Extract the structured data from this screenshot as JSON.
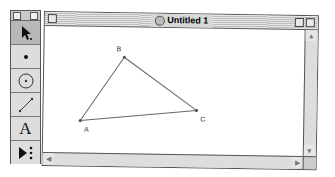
{
  "window": {
    "title": "Untitled 1",
    "icon": "document-icon"
  },
  "palette": {
    "tools": [
      {
        "name": "arrow-select-tool",
        "icon": "arrow-icon",
        "selected": true
      },
      {
        "name": "point-tool",
        "icon": "point-icon"
      },
      {
        "name": "compass-tool",
        "icon": "circle-icon"
      },
      {
        "name": "straightedge-tool",
        "icon": "segment-icon"
      },
      {
        "name": "text-tool",
        "icon": "text-icon",
        "glyph": "A"
      },
      {
        "name": "custom-tool",
        "icon": "custom-tool-icon"
      }
    ]
  },
  "sketch": {
    "points": [
      {
        "label": "A",
        "x": 37,
        "y": 94
      },
      {
        "label": "B",
        "x": 80,
        "y": 30
      },
      {
        "label": "C",
        "x": 153,
        "y": 82
      }
    ],
    "segments": [
      [
        "A",
        "B"
      ],
      [
        "B",
        "C"
      ],
      [
        "C",
        "A"
      ]
    ]
  },
  "scrollbars": {
    "up": "▲",
    "down": "▼",
    "left": "◀",
    "right": "▶"
  }
}
